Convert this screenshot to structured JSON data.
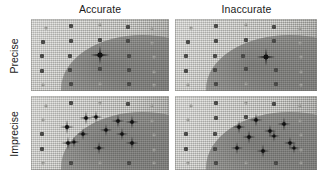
{
  "figure": {
    "caption_columns": [
      "Accurate",
      "Inaccurate"
    ],
    "caption_rows": [
      "Precise",
      "Imprecise"
    ],
    "panel_count": 4,
    "marker_color": "#111111",
    "grid_dot_color": "#4a4a48",
    "board_color": "#c9c9c4"
  },
  "columns": {
    "accurate": "Accurate",
    "inaccurate": "Inaccurate"
  },
  "rows": {
    "precise": "Precise",
    "imprecise": "Imprecise"
  },
  "chart_data": {
    "type": "scatter",
    "title": "",
    "subtitle": "",
    "xlabel": "",
    "ylabel": "",
    "xlim": [
      0,
      100
    ],
    "ylim": [
      0,
      100
    ],
    "grid": true,
    "legend_position": "none",
    "annotations": [
      "Accurate",
      "Inaccurate",
      "Precise",
      "Imprecise"
    ],
    "panels": [
      {
        "id": "accurate-precise",
        "column": "Accurate",
        "row": "Precise",
        "target_center": [
          50,
          50
        ],
        "marker_type": "burst",
        "shots": [
          {
            "x": 50,
            "y": 50,
            "size": 20
          }
        ],
        "grid_dots": [
          {
            "x": 11,
            "y": 13,
            "faint": true
          },
          {
            "x": 29,
            "y": 10,
            "faint": false
          },
          {
            "x": 50,
            "y": 9,
            "faint": true
          },
          {
            "x": 70,
            "y": 11,
            "faint": false
          },
          {
            "x": 88,
            "y": 14,
            "faint": true
          },
          {
            "x": 9,
            "y": 32,
            "faint": false
          },
          {
            "x": 29,
            "y": 30,
            "faint": false
          },
          {
            "x": 50,
            "y": 29,
            "faint": false
          },
          {
            "x": 70,
            "y": 31,
            "faint": false
          },
          {
            "x": 88,
            "y": 34,
            "faint": true
          },
          {
            "x": 8,
            "y": 52,
            "faint": false
          },
          {
            "x": 28,
            "y": 51,
            "faint": false
          },
          {
            "x": 71,
            "y": 51,
            "faint": false
          },
          {
            "x": 89,
            "y": 53,
            "faint": true
          },
          {
            "x": 8,
            "y": 72,
            "faint": false
          },
          {
            "x": 28,
            "y": 71,
            "faint": false
          },
          {
            "x": 50,
            "y": 70,
            "faint": false
          },
          {
            "x": 71,
            "y": 71,
            "faint": false
          },
          {
            "x": 89,
            "y": 73,
            "faint": true
          },
          {
            "x": 9,
            "y": 91,
            "faint": true
          },
          {
            "x": 29,
            "y": 90,
            "faint": false
          },
          {
            "x": 50,
            "y": 90,
            "faint": true
          },
          {
            "x": 71,
            "y": 90,
            "faint": false
          },
          {
            "x": 89,
            "y": 91,
            "faint": true
          }
        ]
      },
      {
        "id": "inaccurate-precise",
        "column": "Inaccurate",
        "row": "Precise",
        "target_center": [
          50,
          50
        ],
        "marker_type": "burst",
        "shots": [
          {
            "x": 64,
            "y": 53,
            "size": 19
          }
        ],
        "grid_dots": [
          {
            "x": 11,
            "y": 13,
            "faint": true
          },
          {
            "x": 29,
            "y": 10,
            "faint": false
          },
          {
            "x": 50,
            "y": 9,
            "faint": true
          },
          {
            "x": 70,
            "y": 11,
            "faint": false
          },
          {
            "x": 88,
            "y": 14,
            "faint": true
          },
          {
            "x": 9,
            "y": 32,
            "faint": false
          },
          {
            "x": 29,
            "y": 30,
            "faint": false
          },
          {
            "x": 50,
            "y": 29,
            "faint": false
          },
          {
            "x": 70,
            "y": 31,
            "faint": false
          },
          {
            "x": 88,
            "y": 34,
            "faint": true
          },
          {
            "x": 8,
            "y": 52,
            "faint": false
          },
          {
            "x": 28,
            "y": 51,
            "faint": false
          },
          {
            "x": 48,
            "y": 51,
            "faint": false
          },
          {
            "x": 89,
            "y": 53,
            "faint": true
          },
          {
            "x": 8,
            "y": 72,
            "faint": false
          },
          {
            "x": 28,
            "y": 71,
            "faint": false
          },
          {
            "x": 50,
            "y": 70,
            "faint": false
          },
          {
            "x": 71,
            "y": 71,
            "faint": false
          },
          {
            "x": 89,
            "y": 73,
            "faint": true
          },
          {
            "x": 9,
            "y": 91,
            "faint": true
          },
          {
            "x": 29,
            "y": 90,
            "faint": false
          },
          {
            "x": 50,
            "y": 90,
            "faint": true
          },
          {
            "x": 71,
            "y": 90,
            "faint": false
          },
          {
            "x": 89,
            "y": 91,
            "faint": true
          }
        ]
      },
      {
        "id": "accurate-imprecise",
        "column": "Accurate",
        "row": "Imprecise",
        "target_center": [
          50,
          50
        ],
        "marker_type": "burst",
        "shots": [
          {
            "x": 26,
            "y": 42,
            "size": 15
          },
          {
            "x": 40,
            "y": 30,
            "size": 14
          },
          {
            "x": 47,
            "y": 28,
            "size": 13
          },
          {
            "x": 63,
            "y": 34,
            "size": 14
          },
          {
            "x": 73,
            "y": 35,
            "size": 14
          },
          {
            "x": 54,
            "y": 46,
            "size": 13
          },
          {
            "x": 38,
            "y": 52,
            "size": 13
          },
          {
            "x": 66,
            "y": 52,
            "size": 13
          },
          {
            "x": 27,
            "y": 64,
            "size": 14
          },
          {
            "x": 31,
            "y": 62,
            "size": 12
          },
          {
            "x": 49,
            "y": 70,
            "size": 13
          },
          {
            "x": 73,
            "y": 63,
            "size": 14
          }
        ],
        "grid_dots": [
          {
            "x": 11,
            "y": 13,
            "faint": true
          },
          {
            "x": 29,
            "y": 10,
            "faint": false
          },
          {
            "x": 50,
            "y": 9,
            "faint": true
          },
          {
            "x": 70,
            "y": 11,
            "faint": false
          },
          {
            "x": 88,
            "y": 14,
            "faint": true
          },
          {
            "x": 9,
            "y": 32,
            "faint": true
          },
          {
            "x": 88,
            "y": 34,
            "faint": true
          },
          {
            "x": 8,
            "y": 52,
            "faint": false
          },
          {
            "x": 89,
            "y": 53,
            "faint": true
          },
          {
            "x": 8,
            "y": 72,
            "faint": false
          },
          {
            "x": 89,
            "y": 73,
            "faint": true
          },
          {
            "x": 9,
            "y": 91,
            "faint": true
          },
          {
            "x": 29,
            "y": 90,
            "faint": false
          },
          {
            "x": 50,
            "y": 90,
            "faint": true
          },
          {
            "x": 71,
            "y": 90,
            "faint": false
          },
          {
            "x": 89,
            "y": 91,
            "faint": true
          }
        ]
      },
      {
        "id": "inaccurate-imprecise",
        "column": "Inaccurate",
        "row": "Imprecise",
        "target_center": [
          50,
          50
        ],
        "marker_type": "burst",
        "shots": [
          {
            "x": 45,
            "y": 42,
            "size": 14
          },
          {
            "x": 57,
            "y": 33,
            "size": 14
          },
          {
            "x": 77,
            "y": 38,
            "size": 14
          },
          {
            "x": 67,
            "y": 47,
            "size": 13
          },
          {
            "x": 52,
            "y": 55,
            "size": 14
          },
          {
            "x": 70,
            "y": 54,
            "size": 12
          },
          {
            "x": 44,
            "y": 70,
            "size": 13
          },
          {
            "x": 62,
            "y": 74,
            "size": 14
          },
          {
            "x": 81,
            "y": 64,
            "size": 13
          },
          {
            "x": 84,
            "y": 70,
            "size": 12
          }
        ],
        "grid_dots": [
          {
            "x": 11,
            "y": 13,
            "faint": true
          },
          {
            "x": 29,
            "y": 10,
            "faint": false
          },
          {
            "x": 50,
            "y": 9,
            "faint": true
          },
          {
            "x": 70,
            "y": 11,
            "faint": false
          },
          {
            "x": 88,
            "y": 14,
            "faint": true
          },
          {
            "x": 9,
            "y": 32,
            "faint": true
          },
          {
            "x": 29,
            "y": 30,
            "faint": false
          },
          {
            "x": 50,
            "y": 29,
            "faint": false
          },
          {
            "x": 88,
            "y": 34,
            "faint": true
          },
          {
            "x": 8,
            "y": 52,
            "faint": false
          },
          {
            "x": 28,
            "y": 51,
            "faint": false
          },
          {
            "x": 89,
            "y": 53,
            "faint": true
          },
          {
            "x": 8,
            "y": 72,
            "faint": false
          },
          {
            "x": 28,
            "y": 71,
            "faint": false
          },
          {
            "x": 89,
            "y": 73,
            "faint": true
          },
          {
            "x": 9,
            "y": 91,
            "faint": true
          },
          {
            "x": 29,
            "y": 90,
            "faint": false
          },
          {
            "x": 50,
            "y": 90,
            "faint": true
          },
          {
            "x": 71,
            "y": 90,
            "faint": false
          },
          {
            "x": 89,
            "y": 91,
            "faint": true
          }
        ]
      }
    ]
  }
}
